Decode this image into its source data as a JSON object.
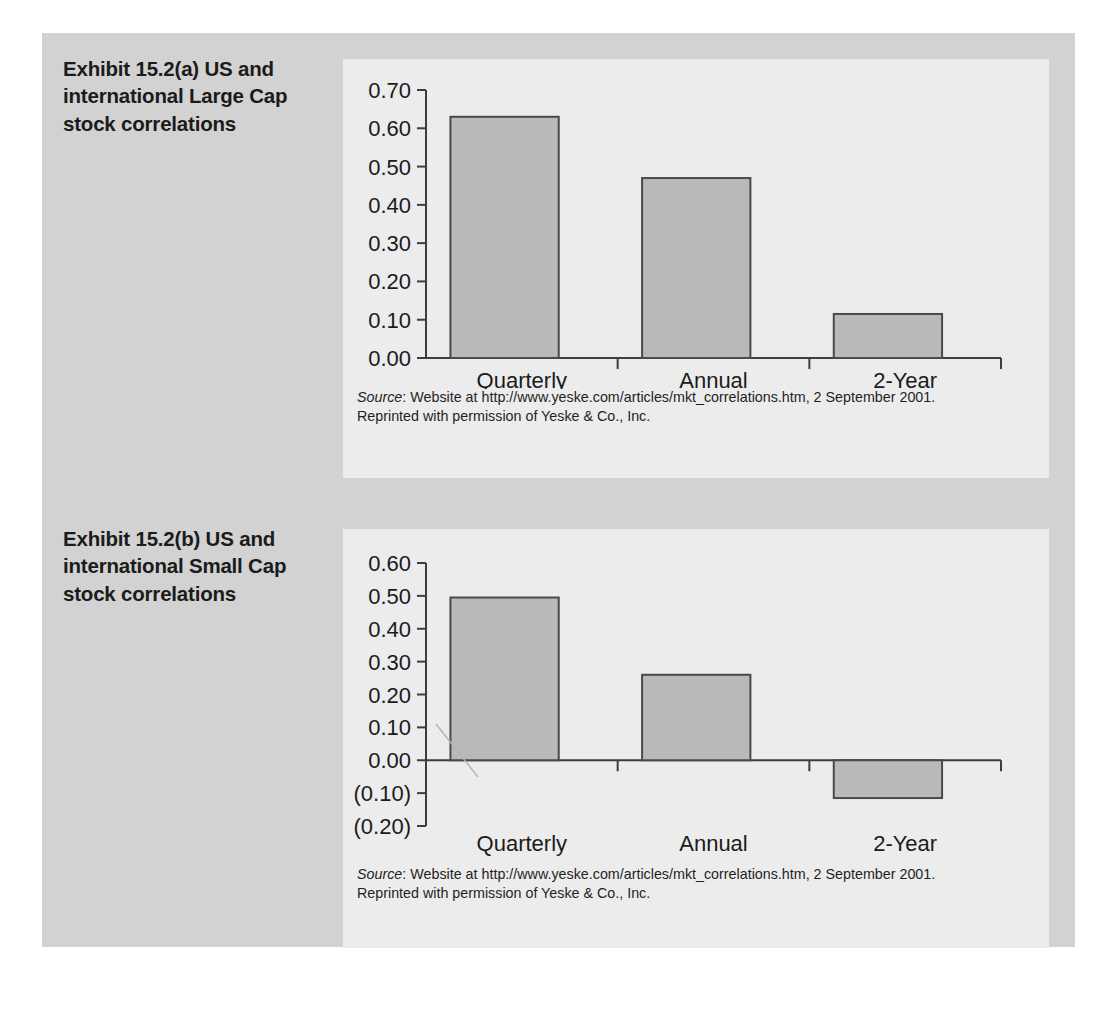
{
  "exhibits": [
    {
      "id": "a",
      "title": "Exhibit 15.2(a)  US and international Large Cap stock correlations",
      "source_label": "Source",
      "source_rest": ": Website at http://www.yeske.com/articles/mkt_correlations.htm, 2 September 2001.",
      "source_line2": "Reprinted with permission of Yeske & Co., Inc.",
      "chart_data": {
        "type": "bar",
        "title": "US and international Large Cap stock correlations",
        "categories": [
          "Quarterly",
          "Annual",
          "2-Year"
        ],
        "values": [
          0.63,
          0.47,
          0.115
        ],
        "xlabel": "",
        "ylabel": "",
        "ylim": [
          0.0,
          0.7
        ],
        "ytick_step": 0.1,
        "ytick_labels": [
          "0.00",
          "0.10",
          "0.20",
          "0.30",
          "0.40",
          "0.50",
          "0.60",
          "0.70"
        ],
        "grid": false,
        "legend": "none",
        "bar_fill": "#b9b9b9",
        "bar_border": "#4a4a4a"
      }
    },
    {
      "id": "b",
      "title": "Exhibit 15.2(b)  US and international Small Cap stock correlations",
      "source_label": "Source",
      "source_rest": ": Website at http://www.yeske.com/articles/mkt_correlations.htm, 2 September 2001.",
      "source_line2": "Reprinted with permission of Yeske & Co., Inc.",
      "chart_data": {
        "type": "bar",
        "title": "US and international Small Cap stock correlations",
        "categories": [
          "Quarterly",
          "Annual",
          "2-Year"
        ],
        "values": [
          0.495,
          0.26,
          -0.115
        ],
        "xlabel": "",
        "ylabel": "",
        "ylim": [
          -0.2,
          0.6
        ],
        "ytick_step": 0.1,
        "ytick_labels": [
          "(0.20)",
          "(0.10)",
          "0.00",
          "0.10",
          "0.20",
          "0.30",
          "0.40",
          "0.50",
          "0.60"
        ],
        "grid": false,
        "legend": "none",
        "bar_fill": "#b9b9b9",
        "bar_border": "#4a4a4a"
      }
    }
  ],
  "colors": {
    "page_background": "#ffffff",
    "panel_background": "#d2d2d2",
    "card_background": "#ececec",
    "bar_fill": "#b9b9b9",
    "bar_border": "#4a4a4a",
    "axis": "#3d3d3d",
    "text": "#1b1b1b"
  }
}
